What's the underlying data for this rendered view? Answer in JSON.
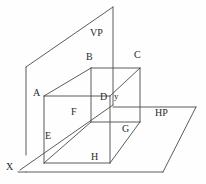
{
  "figure": {
    "kind": "orthographic-projection-diagram",
    "stroke_color": "#4a4a4a",
    "label_color": "#2a2a2a",
    "background_color": "#fefefe"
  },
  "planes": {
    "vp": {
      "label": "VP",
      "x": 90,
      "y": 28
    },
    "hp": {
      "label": "HP",
      "x": 155,
      "y": 108
    },
    "ground_line": {
      "label": "X",
      "x": 6,
      "y": 162
    }
  },
  "vertices": [
    {
      "id": "A",
      "label": "A",
      "x": 33,
      "y": 88
    },
    {
      "id": "B",
      "label": "B",
      "x": 86,
      "y": 52
    },
    {
      "id": "C",
      "label": "C",
      "x": 134,
      "y": 50
    },
    {
      "id": "D",
      "label": "D",
      "x": 100,
      "y": 92
    },
    {
      "id": "E",
      "label": "E",
      "x": 45,
      "y": 131
    },
    {
      "id": "F",
      "label": "F",
      "x": 71,
      "y": 107
    },
    {
      "id": "G",
      "label": "G",
      "x": 122,
      "y": 124
    },
    {
      "id": "H",
      "label": "H",
      "x": 91,
      "y": 152
    },
    {
      "id": "y",
      "label": "y",
      "x": 114,
      "y": 92
    }
  ],
  "geometry": {
    "vp_plane": "26,155 26,67 113,7 113,105",
    "hp_plane": "26,172 163,172 196,107 59,107",
    "ground_line": "18,172 203,172",
    "cuboid_front": "44,96 110,96 110,163 44,163",
    "cuboid_back": "91,68 140,68 140,122 91,122",
    "cuboid_edges": [
      "44,96 91,68",
      "110,96 140,68",
      "110,163 140,122",
      "44,163 91,122"
    ],
    "xy_diagonal": "26,172 113,105"
  }
}
